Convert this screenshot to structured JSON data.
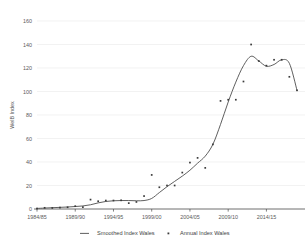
{
  "chart_data": {
    "type": "line",
    "title": "",
    "xlabel": "",
    "ylabel": "WelB Index",
    "ylim": [
      0,
      160
    ],
    "ytick_values": [
      0,
      20,
      40,
      60,
      80,
      100,
      120,
      140,
      160
    ],
    "ytick_labels": [
      "0",
      "20",
      "40",
      "60",
      "80",
      "100",
      "120",
      "140",
      "160"
    ],
    "grid": true,
    "grid_axis": "y",
    "legend_position": "bottom",
    "x_categories": [
      "1984/85",
      "1985/86",
      "1986/87",
      "1987/88",
      "1988/89",
      "1989/90",
      "1990/91",
      "1991/92",
      "1992/93",
      "1993/94",
      "1994/95",
      "1995/96",
      "1996/97",
      "1997/98",
      "1998/99",
      "1999/00",
      "2000/01",
      "2001/02",
      "2002/03",
      "2003/04",
      "2004/05",
      "2005/06",
      "2006/07",
      "2007/08",
      "2008/09",
      "2009/10",
      "2010/11",
      "2011/12",
      "2012/13",
      "2013/14",
      "2014/15",
      "2015/16",
      "2016/17",
      "2017/18",
      "2018/19"
    ],
    "xtick_labels": [
      "1984/85",
      "1989/90",
      "1994/95",
      "1999/00",
      "2004/05",
      "2009/10",
      "2014/15"
    ],
    "xtick_indices": [
      0,
      5,
      10,
      15,
      20,
      25,
      30
    ],
    "series": [
      {
        "name": "Smoothed Index Wales",
        "type": "line",
        "color": "#4d4d4d",
        "values": [
          0.5,
          0.8,
          1.1,
          1.4,
          1.7,
          2.1,
          2.6,
          3.6,
          5.2,
          6.4,
          7.0,
          7.2,
          7.2,
          7.0,
          7.2,
          9.0,
          14.0,
          19.0,
          23.5,
          28.0,
          33.0,
          39.0,
          45.0,
          55.0,
          72.0,
          91.0,
          108.0,
          122.0,
          130.0,
          126.0,
          121.5,
          123.0,
          127.0,
          124.0,
          101.0
        ]
      },
      {
        "name": "Annual Index Wales",
        "type": "scatter",
        "color": "#3a3a3a",
        "marker": "square",
        "values": [
          0.4,
          1.0,
          0.9,
          1.2,
          1.5,
          2.4,
          1.6,
          8.0,
          6.6,
          7.2,
          7.2,
          7.4,
          5.0,
          6.0,
          11.0,
          29.0,
          18.5,
          20.0,
          20.0,
          31.0,
          39.5,
          43.5,
          35.0,
          55.0,
          92.0,
          93.0,
          93.0,
          108.5,
          140.0,
          126.0,
          122.0,
          127.0,
          127.0,
          112.5,
          101.0
        ]
      }
    ]
  },
  "legend": {
    "items": [
      {
        "label": "Smoothed Index Wales",
        "symbol": "line"
      },
      {
        "label": "Annual Index Wales",
        "symbol": "square"
      }
    ]
  }
}
